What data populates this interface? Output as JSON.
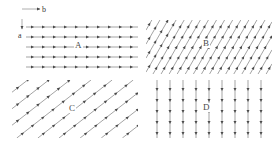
{
  "figure": {
    "width": 279,
    "height": 146,
    "background": "#ffffff",
    "line_color": "#666666",
    "arrow_color": "#4a4a4a",
    "text_color": "#3a3a3a"
  },
  "axes": {
    "horizontal": {
      "label": "b",
      "direction": "right",
      "icon": "arrow-right-icon"
    },
    "vertical": {
      "label": "a",
      "direction": "down",
      "icon": "arrow-down-icon"
    }
  },
  "panels": [
    {
      "id": "A",
      "label": "A",
      "pattern": "horizontal-lines",
      "angle_deg": 0,
      "arrow_direction": "right",
      "line_count": 6,
      "line_spacing_px": 10,
      "arrows_per_line": 10
    },
    {
      "id": "B",
      "label": "B",
      "pattern": "diagonal-lines-steep",
      "angle_deg": 60,
      "arrow_direction": "up-right",
      "line_count": 18,
      "line_spacing_px": 7,
      "arrows_per_line": 5
    },
    {
      "id": "C",
      "label": "C",
      "pattern": "diagonal-lines-shallow",
      "angle_deg": 38,
      "arrow_direction": "up-right",
      "line_count": 11,
      "line_spacing_px": 13,
      "arrows_per_line": 6
    },
    {
      "id": "D",
      "label": "D",
      "pattern": "vertical-lines",
      "angle_deg": 90,
      "arrow_direction": "down",
      "line_count": 10,
      "line_spacing_px": 13,
      "arrows_per_line": 6
    }
  ]
}
